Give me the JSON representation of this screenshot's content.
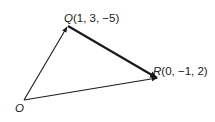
{
  "diagram": {
    "type": "vector-triangle",
    "points": {
      "O": {
        "name": "O",
        "coords": "",
        "px": [
          24,
          100
        ]
      },
      "Q": {
        "name": "Q",
        "coords": "(1, 3, −5)",
        "px": [
          68,
          26
        ]
      },
      "R": {
        "name": "R",
        "coords": "(0, −1, 2)",
        "px": [
          158,
          78
        ]
      }
    },
    "edges": [
      {
        "from": "O",
        "to": "Q",
        "arrow": "end",
        "weight": "thin"
      },
      {
        "from": "Q",
        "to": "R",
        "arrow": "end",
        "weight": "thick"
      },
      {
        "from": "O",
        "to": "R",
        "arrow": "end",
        "weight": "thin"
      }
    ],
    "colors": {
      "stroke": "#1a1a1a",
      "background": "#ffffff"
    }
  }
}
